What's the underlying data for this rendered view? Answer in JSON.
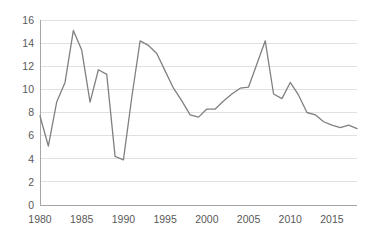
{
  "chart_data": {
    "type": "line",
    "title": "",
    "subtitle": "",
    "xlabel": "",
    "ylabel": "",
    "xlim": [
      1980,
      2018
    ],
    "ylim": [
      0,
      16
    ],
    "grid": true,
    "legend": false,
    "legend_position": "none",
    "line_color": "#808080",
    "gridline_color": "#d9d9d9",
    "axis_color": "#a6a6a6",
    "tick_label_color": "#595959",
    "y_ticks": [
      0,
      2,
      4,
      6,
      8,
      10,
      12,
      14,
      16
    ],
    "y_tick_labels": [
      "0",
      "2",
      "4",
      "6",
      "8",
      "10",
      "12",
      "14",
      "16"
    ],
    "x_ticks": [
      1980,
      1985,
      1990,
      1995,
      2000,
      2005,
      2010,
      2015
    ],
    "x_tick_labels": [
      "1980",
      "1985",
      "1990",
      "1995",
      "2000",
      "2005",
      "2010",
      "2015"
    ],
    "x": [
      1980,
      1981,
      1982,
      1983,
      1984,
      1985,
      1986,
      1987,
      1988,
      1989,
      1990,
      1991,
      1992,
      1993,
      1994,
      1995,
      1996,
      1997,
      1998,
      1999,
      2000,
      2001,
      2002,
      2003,
      2004,
      2005,
      2006,
      2007,
      2008,
      2009,
      2010,
      2011,
      2012,
      2013,
      2014,
      2015,
      2016,
      2017,
      2018
    ],
    "series": [
      {
        "name": "series-1",
        "color": "#808080",
        "values": [
          7.7,
          5.1,
          8.9,
          10.6,
          15.1,
          13.4,
          8.9,
          11.7,
          11.3,
          4.2,
          3.9,
          9.3,
          14.2,
          13.8,
          13.1,
          11.6,
          10.1,
          9.0,
          7.8,
          7.6,
          8.3,
          8.3,
          9.0,
          9.6,
          10.1,
          10.2,
          12.2,
          14.2,
          9.6,
          9.2,
          10.6,
          9.5,
          8.0,
          7.8,
          7.2,
          6.9,
          6.7,
          6.9,
          6.6
        ]
      }
    ]
  }
}
